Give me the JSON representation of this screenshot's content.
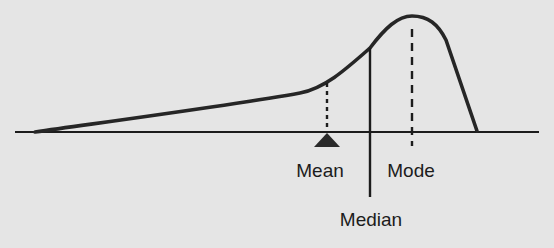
{
  "diagram": {
    "labels": {
      "mean": "Mean",
      "median": "Median",
      "mode": "Mode"
    },
    "colors": {
      "background": "#e5e5e5",
      "ink": "#1c1c1c",
      "curve": "#262626"
    },
    "order_left_to_right": [
      "Mean",
      "Median",
      "Mode"
    ],
    "markers": [
      {
        "name": "Mean",
        "style": "dotted",
        "indicator": "triangle-fulcrum"
      },
      {
        "name": "Median",
        "style": "solid"
      },
      {
        "name": "Mode",
        "style": "dashed"
      }
    ]
  }
}
